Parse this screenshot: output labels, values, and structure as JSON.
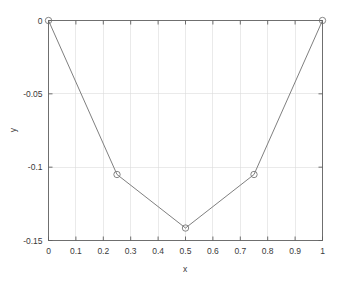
{
  "chart_data": {
    "type": "line",
    "title": "",
    "subtitle": "",
    "xlabel": "x",
    "ylabel": "y",
    "x": [
      0,
      0.25,
      0.5,
      0.75,
      1
    ],
    "values": [
      0,
      -0.105,
      -0.1415,
      -0.105,
      0
    ],
    "series": [
      {
        "name": "y",
        "x": [
          0,
          0.25,
          0.5,
          0.75,
          1
        ],
        "values": [
          0,
          -0.105,
          -0.1415,
          -0.105,
          0
        ]
      }
    ],
    "xlim": [
      0,
      1
    ],
    "ylim": [
      -0.15,
      0
    ],
    "xticks": [
      0,
      0.1,
      0.2,
      0.3,
      0.4,
      0.5,
      0.6,
      0.7,
      0.8,
      0.9,
      1
    ],
    "yticks": [
      0,
      -0.05,
      -0.1,
      -0.15
    ],
    "xticklabels": [
      "0",
      "0.1",
      "0.2",
      "0.3",
      "0.4",
      "0.5",
      "0.6",
      "0.7",
      "0.8",
      "0.9",
      "1"
    ],
    "yticklabels": [
      "0",
      "-0.05",
      "-0.1",
      "-0.15"
    ],
    "grid": true,
    "legend": null,
    "legend_position": "none",
    "marker": "circle-open",
    "line_color": "#787878",
    "marker_color": "#787878",
    "grid_color": "#d8d8d8",
    "axis_color": "#606060",
    "background_color": "#ffffff"
  },
  "axes": {
    "x_title": "x",
    "y_title": "y"
  },
  "labels": {
    "x": [
      "0",
      "0.1",
      "0.2",
      "0.3",
      "0.4",
      "0.5",
      "0.6",
      "0.7",
      "0.8",
      "0.9",
      "1"
    ],
    "y": [
      "0",
      "-0.05",
      "-0.1",
      "-0.15"
    ]
  }
}
